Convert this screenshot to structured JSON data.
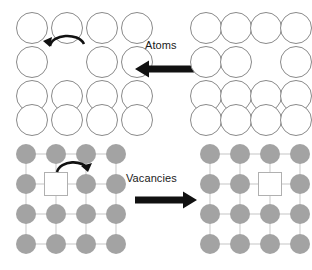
{
  "figure": {
    "background_color": "#ffffff",
    "width": 312,
    "height": 270
  },
  "colors": {
    "open_circle_stroke": "#8a8a8a",
    "open_circle_fill": "#ffffff",
    "filled_circle": "#a3a3a3",
    "lattice_line": "#d8d8d8",
    "vacancy_square_stroke": "#b0b0b0",
    "vacancy_square_fill": "#ffffff",
    "arrow_black": "#111111",
    "text": "#1a1a1a"
  },
  "labels": {
    "atoms": "Atoms",
    "vacancies": "Vacancies"
  },
  "rows": [
    {
      "id": "atoms-row",
      "label": "Atoms",
      "arrow_direction": "left",
      "arrow_name": "atoms-flow-arrow",
      "panels": [
        {
          "id": "atoms-left-panel",
          "style": "open-circles",
          "columns": 4,
          "rows": 4,
          "vacancy_cell": {
            "row": 2,
            "col": 2
          },
          "jump_arrow": {
            "direction": "left",
            "from_col": 3,
            "to_col": 2,
            "row": 2
          }
        },
        {
          "id": "atoms-right-panel",
          "style": "open-circles",
          "columns": 4,
          "rows": 4,
          "vacancy_cell": {
            "row": 2,
            "col": 3
          },
          "jump_arrow": null
        }
      ]
    },
    {
      "id": "vacancies-row",
      "label": "Vacancies",
      "arrow_direction": "right",
      "arrow_name": "vacancies-flow-arrow",
      "panels": [
        {
          "id": "vacancies-left-panel",
          "style": "filled-circles-lattice",
          "columns": 4,
          "rows": 4,
          "vacancy_cell": {
            "row": 2,
            "col": 2
          },
          "jump_arrow": {
            "direction": "right",
            "from_col": 2,
            "to_col": 3,
            "row": 2
          }
        },
        {
          "id": "vacancies-right-panel",
          "style": "filled-circles-lattice",
          "columns": 4,
          "rows": 4,
          "vacancy_cell": {
            "row": 2,
            "col": 3
          },
          "jump_arrow": null
        }
      ]
    }
  ]
}
